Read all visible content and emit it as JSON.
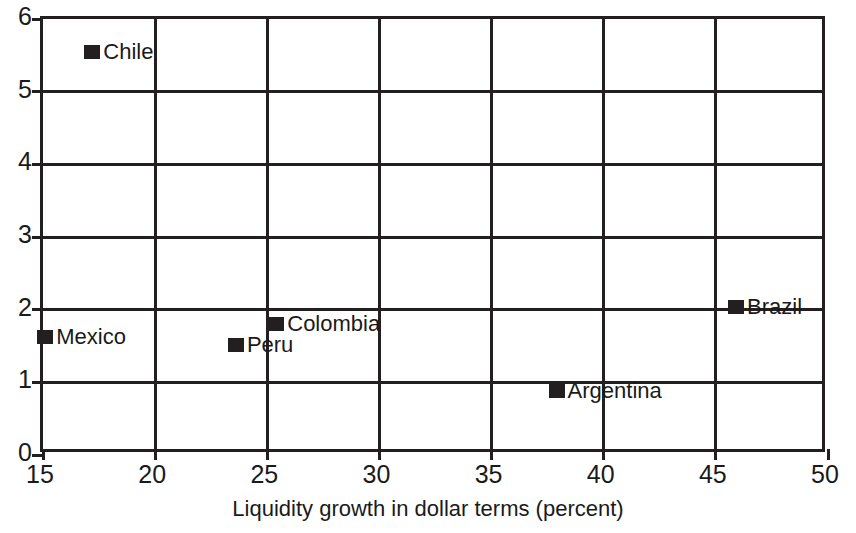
{
  "chart_data": {
    "type": "scatter",
    "title": "",
    "xlabel": "Liquidity growth in dollar terms (percent)",
    "ylabel": "",
    "xlim": [
      15,
      50
    ],
    "ylim": [
      0,
      6
    ],
    "xticks": [
      "15",
      "20",
      "25",
      "30",
      "35",
      "40",
      "45",
      "50"
    ],
    "yticks": [
      "0",
      "1",
      "2",
      "3",
      "4",
      "5",
      "6"
    ],
    "grid": "both",
    "legend": "none",
    "marker_color": "#231f20",
    "points": [
      {
        "label": "Chile",
        "x": 17.2,
        "y": 5.55,
        "label_pos": "right"
      },
      {
        "label": "Mexico",
        "x": 15.1,
        "y": 1.62,
        "label_pos": "right"
      },
      {
        "label": "Peru",
        "x": 23.6,
        "y": 1.52,
        "label_pos": "right"
      },
      {
        "label": "Colombia",
        "x": 25.4,
        "y": 1.8,
        "label_pos": "right"
      },
      {
        "label": "Argentina",
        "x": 37.9,
        "y": 0.88,
        "label_pos": "right"
      },
      {
        "label": "Brazil",
        "x": 45.9,
        "y": 2.04,
        "label_pos": "right"
      }
    ]
  }
}
